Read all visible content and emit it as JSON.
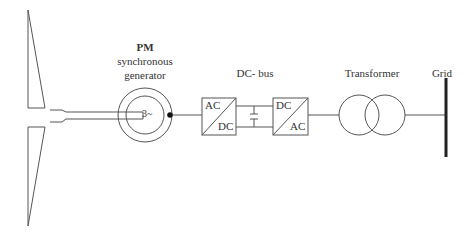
{
  "diagram": {
    "type": "wind-turbine-pmsg-power-conversion-chain",
    "components": [
      {
        "id": "turbine",
        "label": ""
      },
      {
        "id": "generator",
        "label_bold": "PM",
        "label_line2": "synchronous",
        "label_line3": "generator",
        "inner_text": "3~"
      },
      {
        "id": "rectifier",
        "top_text": "AC",
        "bottom_text": "DC"
      },
      {
        "id": "dc_bus",
        "label": "DC- bus"
      },
      {
        "id": "inverter",
        "top_text": "DC",
        "bottom_text": "AC"
      },
      {
        "id": "transformer",
        "label": "Transformer"
      },
      {
        "id": "grid",
        "label": "Grid"
      }
    ],
    "connections": [
      [
        "turbine",
        "generator"
      ],
      [
        "generator",
        "rectifier"
      ],
      [
        "rectifier",
        "dc_bus"
      ],
      [
        "dc_bus",
        "inverter"
      ],
      [
        "inverter",
        "transformer"
      ],
      [
        "transformer",
        "grid"
      ]
    ],
    "colors": {
      "line": "#555555",
      "grid_bar": "#222222",
      "background": "#ffffff"
    }
  }
}
